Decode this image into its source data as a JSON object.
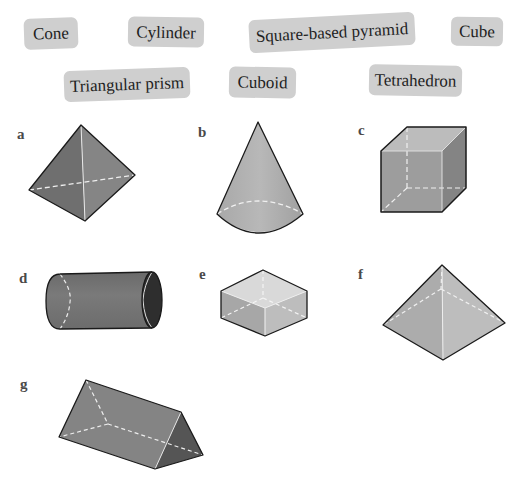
{
  "word_bank": {
    "row1": [
      "Cone",
      "Cylinder",
      "Square-based pyramid",
      "Cube"
    ],
    "row2": [
      "Triangular prism",
      "Cuboid",
      "Tetrahedron"
    ]
  },
  "shapes": [
    {
      "letter": "a",
      "depicts": "tetrahedron"
    },
    {
      "letter": "b",
      "depicts": "cone"
    },
    {
      "letter": "c",
      "depicts": "cube"
    },
    {
      "letter": "d",
      "depicts": "cylinder"
    },
    {
      "letter": "e",
      "depicts": "cuboid"
    },
    {
      "letter": "f",
      "depicts": "square-based pyramid"
    },
    {
      "letter": "g",
      "depicts": "triangular prism"
    }
  ],
  "colors": {
    "pill_bg": "#cfcfcf",
    "edge": "#1a1a1a",
    "hidden_edge": "#f2f2f2",
    "face_dark": "#6e6e6e",
    "face_mid": "#8f8f8f",
    "face_light": "#b5b5b5"
  }
}
